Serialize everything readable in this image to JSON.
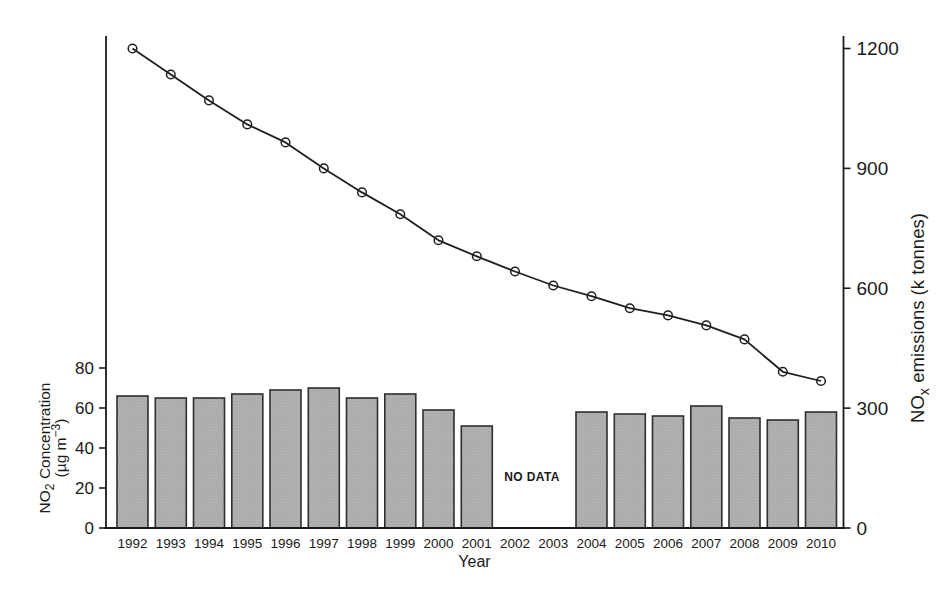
{
  "figure": {
    "xlabel": "Year",
    "no_data_text": "NO DATA"
  },
  "chart_data": {
    "type": "combo-bar-line",
    "categories": [
      "1992",
      "1993",
      "1994",
      "1995",
      "1996",
      "1997",
      "1998",
      "1999",
      "2000",
      "2001",
      "2002",
      "2003",
      "2004",
      "2005",
      "2006",
      "2007",
      "2008",
      "2009",
      "2010"
    ],
    "series": [
      {
        "name": "NO2 Concentration (ug m-3)",
        "type": "bar",
        "axis": "left",
        "values": [
          66,
          65,
          65,
          67,
          69,
          70,
          65,
          67,
          59,
          51,
          null,
          null,
          58,
          57,
          56,
          61,
          55,
          54,
          58
        ]
      },
      {
        "name": "NOx emissions (k tonnes)",
        "type": "line",
        "axis": "right",
        "values": [
          1200,
          1135,
          1070,
          1010,
          965,
          900,
          840,
          785,
          720,
          680,
          642,
          607,
          580,
          550,
          532,
          507,
          472,
          391,
          368
        ]
      }
    ],
    "left_axis": {
      "ticks": [
        0,
        20,
        40,
        60,
        80
      ],
      "label_lines": [
        [
          {
            "t": "NO"
          },
          {
            "t": "2",
            "sub": true
          },
          {
            "t": " Concentration"
          }
        ],
        [
          {
            "t": "(µg m"
          },
          {
            "t": "−3",
            "sup": true
          },
          {
            "t": ")"
          }
        ]
      ]
    },
    "right_axis": {
      "ticks": [
        0,
        300,
        600,
        900,
        1200
      ],
      "label_parts": [
        {
          "t": "NO"
        },
        {
          "t": "x",
          "sub": true
        },
        {
          "t": " emissions (k tonnes)"
        }
      ]
    },
    "xlabel": "Year",
    "no_data": {
      "text": "NO DATA",
      "between": [
        "2002",
        "2003"
      ]
    },
    "ylim_left": [
      0,
      245
    ],
    "ylim_right": [
      0,
      1228
    ],
    "grid": false,
    "legend": "none",
    "colors": {
      "bar_fill": "#b4b4b4",
      "bar_dot": "#9c9c9c",
      "bar_stroke": "#2e2e2e",
      "line": "#1f1f1f",
      "marker_stroke": "#1f1f1f",
      "axis": "#1a1a1a",
      "text": "#1a1a1a",
      "background": "#ffffff"
    }
  }
}
